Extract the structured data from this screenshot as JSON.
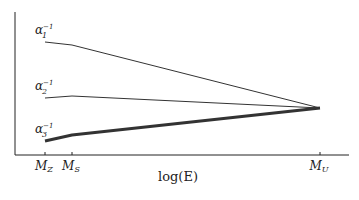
{
  "chart_data": {
    "type": "line",
    "title": "",
    "xlabel": "log(E)",
    "ylabel": "",
    "x_ticks": [
      {
        "label": "M_Z",
        "base": "M",
        "sub": "Z",
        "x": 45
      },
      {
        "label": "M_S",
        "base": "M",
        "sub": "S",
        "x": 72
      },
      {
        "label": "M_U",
        "base": "M",
        "sub": "U",
        "x": 320
      }
    ],
    "x_ticks_display": [
      "M_Z",
      "M_S",
      "M_U"
    ],
    "grid": false,
    "legend": "inline labels at left of each line",
    "series": [
      {
        "name": "α1⁻¹",
        "label_base": "α",
        "label_sub": "1",
        "label_sup": "−1",
        "stroke_width": 1,
        "points": [
          [
            "M_Z",
            42
          ],
          [
            "M_S",
            45
          ],
          [
            "M_U",
            108
          ]
        ],
        "pixel_points": [
          [
            45,
            42
          ],
          [
            72,
            45
          ],
          [
            320,
            108
          ]
        ]
      },
      {
        "name": "α2⁻¹",
        "label_base": "α",
        "label_sub": "2",
        "label_sup": "−1",
        "stroke_width": 1,
        "points": [
          [
            "M_Z",
            98
          ],
          [
            "M_S",
            96
          ],
          [
            "M_U",
            108
          ]
        ],
        "pixel_points": [
          [
            45,
            98
          ],
          [
            72,
            96
          ],
          [
            320,
            108
          ]
        ]
      },
      {
        "name": "α3⁻¹",
        "label_base": "α",
        "label_sub": "3",
        "label_sup": "−1",
        "stroke_width": 3,
        "points": [
          [
            "M_Z",
            141
          ],
          [
            "M_S",
            135
          ],
          [
            "M_U",
            108
          ]
        ],
        "pixel_points": [
          [
            45,
            141
          ],
          [
            72,
            135
          ],
          [
            320,
            108
          ]
        ]
      }
    ],
    "annotations": [
      "Three inverse gauge couplings unify at M_U"
    ]
  },
  "colors": {
    "line": "#333333",
    "axis": "#222222",
    "background": "#ffffff"
  }
}
